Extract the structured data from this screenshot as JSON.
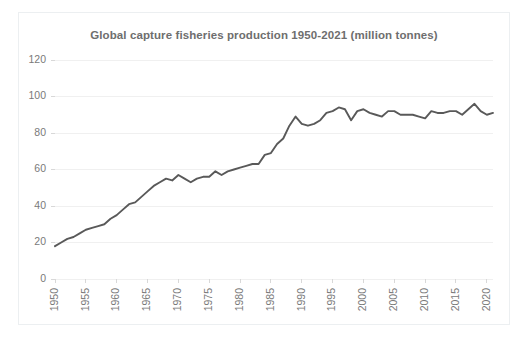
{
  "chart_data": {
    "type": "line",
    "title": "Global capture fisheries production 1950-2021 (million tonnes)",
    "xlabel": "",
    "ylabel": "",
    "xlim": [
      1950,
      2021
    ],
    "ylim": [
      0,
      120
    ],
    "grid": true,
    "legend": false,
    "legend_position": "none",
    "line_color": "#595959",
    "title_color": "#6e6e6e",
    "grid_color": "#f0f0f0",
    "axis_text_color": "#7a7a7a",
    "ytick_labels": [
      "0",
      "20",
      "40",
      "60",
      "80",
      "100",
      "120"
    ],
    "ytick_values": [
      0,
      20,
      40,
      60,
      80,
      100,
      120
    ],
    "xtick_labels": [
      "1950",
      "1955",
      "1960",
      "1965",
      "1970",
      "1975",
      "1980",
      "1985",
      "1990",
      "1995",
      "2000",
      "2005",
      "2010",
      "2015",
      "2020"
    ],
    "xtick_values": [
      1950,
      1955,
      1960,
      1965,
      1970,
      1975,
      1980,
      1985,
      1990,
      1995,
      2000,
      2005,
      2010,
      2015,
      2020
    ],
    "xtick_rotation": 90,
    "series": [
      {
        "name": "Global capture fisheries production",
        "x": [
          1950,
          1951,
          1952,
          1953,
          1954,
          1955,
          1956,
          1957,
          1958,
          1959,
          1960,
          1961,
          1962,
          1963,
          1964,
          1965,
          1966,
          1967,
          1968,
          1969,
          1970,
          1971,
          1972,
          1973,
          1974,
          1975,
          1976,
          1977,
          1978,
          1979,
          1980,
          1981,
          1982,
          1983,
          1984,
          1985,
          1986,
          1987,
          1988,
          1989,
          1990,
          1991,
          1992,
          1993,
          1994,
          1995,
          1996,
          1997,
          1998,
          1999,
          2000,
          2001,
          2002,
          2003,
          2004,
          2005,
          2006,
          2007,
          2008,
          2009,
          2010,
          2011,
          2012,
          2013,
          2014,
          2015,
          2016,
          2017,
          2018,
          2019,
          2020,
          2021
        ],
        "values": [
          18,
          20,
          22,
          23,
          25,
          27,
          28,
          29,
          30,
          33,
          35,
          38,
          41,
          42,
          45,
          48,
          51,
          53,
          55,
          54,
          57,
          55,
          53,
          55,
          56,
          56,
          59,
          57,
          59,
          60,
          61,
          62,
          63,
          63,
          68,
          69,
          74,
          77,
          84,
          89,
          85,
          84,
          85,
          87,
          91,
          92,
          94,
          93,
          87,
          92,
          93,
          91,
          90,
          89,
          92,
          92,
          90,
          90,
          90,
          89,
          88,
          92,
          91,
          91,
          92,
          92,
          90,
          93,
          96,
          92,
          90,
          91
        ]
      }
    ]
  }
}
